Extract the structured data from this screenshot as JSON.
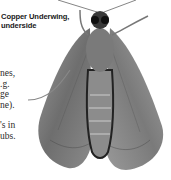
{
  "figure": {
    "caption_line1": "Copper Underwing,",
    "caption_line2": "underside"
  },
  "body_text": {
    "lines_block1": [
      "nes,",
      ".g.",
      "ge",
      "ne)."
    ],
    "lines_block2": [
      "'s in",
      "ubs."
    ]
  },
  "colors": {
    "background": "#ffffff",
    "text": "#2a2a2a"
  }
}
